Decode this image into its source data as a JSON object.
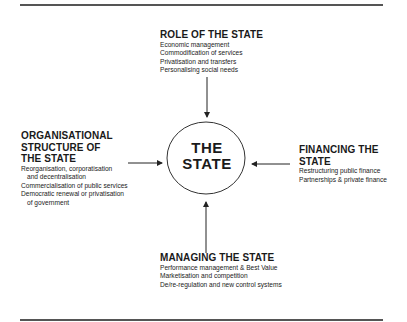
{
  "diagram": {
    "center": {
      "line1": "THE",
      "line2": "STATE"
    },
    "top": {
      "heading": "ROLE OF THE STATE",
      "items": [
        "Economic management",
        "Commodification of services",
        "Privatisation and transfers",
        "Personalising social needs"
      ]
    },
    "left": {
      "heading_lines": [
        "ORGANISATIONAL",
        "STRUCTURE OF",
        "THE STATE"
      ],
      "items": [
        "Reorganisation, corporatisation",
        "and decentralisation",
        "Commercialisation of public services",
        "Democratic renewal or privatisation",
        "of government"
      ]
    },
    "right": {
      "heading_lines": [
        "FINANCING THE",
        "STATE"
      ],
      "items": [
        "Restructuring public finance",
        "Partnerships & private finance"
      ]
    },
    "bottom": {
      "heading": "MANAGING THE STATE",
      "items": [
        "Performance management & Best Value",
        "Marketisation and competition",
        "De/re-regulation and new control systems"
      ]
    },
    "colors": {
      "line": "#555555",
      "text": "#1a1a1a",
      "background": "#ffffff"
    }
  }
}
